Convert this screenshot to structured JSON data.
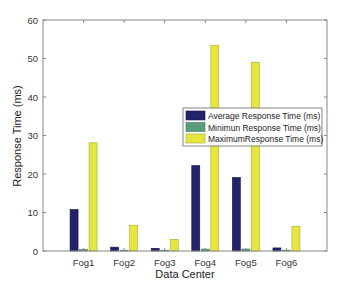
{
  "chart_data": {
    "type": "bar",
    "title": "",
    "xlabel": "Data Center",
    "ylabel": "Response Time (ms)",
    "ylim": [
      0,
      60
    ],
    "yticks": [
      0,
      10,
      20,
      30,
      40,
      50,
      60
    ],
    "grid": false,
    "legend_position": "inside right, middle",
    "categories": [
      "Fog1",
      "Fog2",
      "Fog3",
      "Fog4",
      "Fog5",
      "Fog6"
    ],
    "series": [
      {
        "name": "Average Response Time (ms)",
        "color": "#23236b",
        "values": [
          10.8,
          1.0,
          0.7,
          22.2,
          19.1,
          0.8
        ]
      },
      {
        "name": "Minimun Response Time (ms)",
        "color": "#5a9c7c",
        "values": [
          0.4,
          0.2,
          0.2,
          0.5,
          0.5,
          0.2
        ]
      },
      {
        "name": "MaximumResponse Time (ms)",
        "color": "#e6e63c",
        "values": [
          28.1,
          6.7,
          3.0,
          53.4,
          49.0,
          6.4
        ]
      }
    ]
  }
}
